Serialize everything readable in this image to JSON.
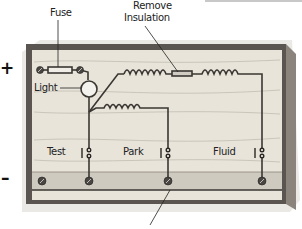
{
  "diagram": {
    "type": "wiring board illustration",
    "labels": {
      "fuse": "Fuse",
      "remove_insulation_line1": "Remove",
      "remove_insulation_line2": "Insulation",
      "light": "Light",
      "test": "Test",
      "park": "Park",
      "fluid": "Fluid"
    },
    "terminals": {
      "positive": "+",
      "negative": "–"
    },
    "colors": {
      "wood": "#e6e2d8",
      "wood_grain": "#b8b2a6",
      "frame_dark": "#4a4642",
      "frame_mid": "#8a847c",
      "wire": "#3a3632",
      "bottom_strip": "#cfcac0"
    }
  }
}
